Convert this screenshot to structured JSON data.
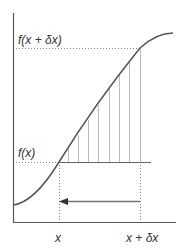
{
  "diagram": {
    "labels": {
      "f_x_plus_dx": "f(x + δx)",
      "f_x": "f(x)",
      "x": "x",
      "x_plus_dx": "x + δx"
    },
    "colors": {
      "curve": "#555555",
      "axis": "#555555",
      "hatch": "#bbbbbb",
      "dotted": "#888888",
      "arrow": "#777777",
      "text": "#333333"
    },
    "geometry": {
      "axis_origin": [
        13,
        222
      ],
      "y_axis_top": 13,
      "x_axis_right": 176,
      "x_pos": 59,
      "x_plus_dx_pos": 140,
      "f_x_y": 162,
      "f_x_plus_dx_y": 48,
      "arrow_y": 201,
      "hatch_x": [
        68,
        78,
        88,
        98,
        109,
        119,
        129,
        140
      ]
    }
  }
}
